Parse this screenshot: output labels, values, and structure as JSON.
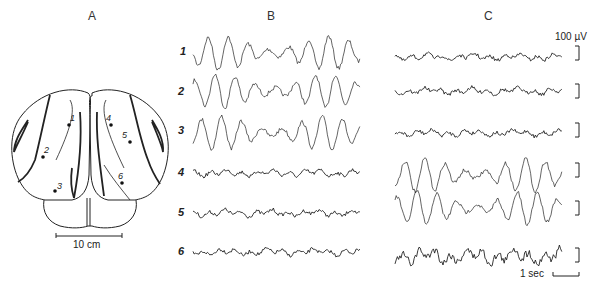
{
  "panels": {
    "a": {
      "label": "A",
      "scale_bar": "10 cm",
      "electrodes": [
        {
          "id": "1",
          "x": 69,
          "y": 125
        },
        {
          "id": "2",
          "x": 43,
          "y": 157
        },
        {
          "id": "3",
          "x": 55,
          "y": 191
        },
        {
          "id": "4",
          "x": 111,
          "y": 125
        },
        {
          "id": "5",
          "x": 130,
          "y": 142
        },
        {
          "id": "6",
          "x": 122,
          "y": 183
        }
      ]
    },
    "b": {
      "label": "B",
      "traces": [
        {
          "num": "1",
          "amplitude": "large"
        },
        {
          "num": "2",
          "amplitude": "large"
        },
        {
          "num": "3",
          "amplitude": "large"
        },
        {
          "num": "4",
          "amplitude": "small"
        },
        {
          "num": "5",
          "amplitude": "small"
        },
        {
          "num": "6",
          "amplitude": "small"
        }
      ]
    },
    "c": {
      "label": "C",
      "voltage_scale": "100 µV",
      "time_scale": "1 sec",
      "traces": [
        {
          "amplitude": "small"
        },
        {
          "amplitude": "small"
        },
        {
          "amplitude": "small"
        },
        {
          "amplitude": "large"
        },
        {
          "amplitude": "large"
        },
        {
          "amplitude": "medium"
        }
      ]
    }
  }
}
